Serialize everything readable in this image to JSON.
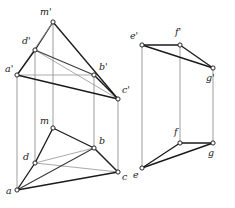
{
  "figure": {
    "type": "descriptive-geometry-diagram",
    "stroke_colors": {
      "dark": "#1b1b1b",
      "mid": "#3a3a3a",
      "light": "#9a9a9a",
      "connector": "#8c8c8c",
      "vertex_fill": "#ffffff",
      "background": "#ffffff"
    },
    "left_object": {
      "name": "left-prism",
      "upper_projection": {
        "name": "upper-view-left",
        "vertices": [
          {
            "id": "m_prime",
            "label": "m'",
            "x": 53,
            "y": 22,
            "label_x": 40,
            "label_y": 15
          },
          {
            "id": "d_prime",
            "label": "d'",
            "x": 35,
            "y": 50,
            "label_x": 22,
            "label_y": 44
          },
          {
            "id": "a_prime",
            "label": "a'",
            "x": 17,
            "y": 75,
            "label_x": 5,
            "label_y": 72
          },
          {
            "id": "b_prime",
            "label": "b'",
            "x": 94,
            "y": 75,
            "label_x": 99,
            "label_y": 70
          },
          {
            "id": "c_prime",
            "label": "c'",
            "x": 118,
            "y": 99,
            "label_x": 122,
            "label_y": 93
          }
        ],
        "edges": [
          {
            "from": "m_prime",
            "to": "d_prime",
            "weight": "dark"
          },
          {
            "from": "m_prime",
            "to": "c_prime",
            "weight": "dark"
          },
          {
            "from": "m_prime",
            "to": "a_prime",
            "weight": "light"
          },
          {
            "from": "d_prime",
            "to": "a_prime",
            "weight": "dark"
          },
          {
            "from": "d_prime",
            "to": "c_prime",
            "weight": "light"
          },
          {
            "from": "d_prime",
            "to": "b_prime",
            "weight": "mid"
          },
          {
            "from": "a_prime",
            "to": "b_prime",
            "weight": "light"
          },
          {
            "from": "a_prime",
            "to": "c_prime",
            "weight": "dark"
          },
          {
            "from": "b_prime",
            "to": "c_prime",
            "weight": "dark"
          }
        ]
      },
      "lower_projection": {
        "name": "lower-view-left",
        "vertices": [
          {
            "id": "m",
            "label": "m",
            "x": 53,
            "y": 128,
            "label_x": 40,
            "label_y": 124
          },
          {
            "id": "d",
            "label": "d",
            "x": 35,
            "y": 163,
            "label_x": 23,
            "label_y": 160
          },
          {
            "id": "a",
            "label": "a",
            "x": 17,
            "y": 190,
            "label_x": 6,
            "label_y": 194
          },
          {
            "id": "b",
            "label": "b",
            "x": 94,
            "y": 148,
            "label_x": 99,
            "label_y": 144
          },
          {
            "id": "c",
            "label": "c",
            "x": 118,
            "y": 172,
            "label_x": 122,
            "label_y": 180
          }
        ],
        "edges": [
          {
            "from": "m",
            "to": "d",
            "weight": "dark"
          },
          {
            "from": "m",
            "to": "b",
            "weight": "dark"
          },
          {
            "from": "d",
            "to": "a",
            "weight": "dark"
          },
          {
            "from": "d",
            "to": "b",
            "weight": "light"
          },
          {
            "from": "d",
            "to": "c",
            "weight": "light"
          },
          {
            "from": "a",
            "to": "b",
            "weight": "mid"
          },
          {
            "from": "a",
            "to": "c",
            "weight": "dark"
          },
          {
            "from": "b",
            "to": "c",
            "weight": "dark"
          }
        ]
      },
      "connectors": [
        {
          "from": "a_prime",
          "to": "a"
        },
        {
          "from": "d_prime",
          "to": "d"
        },
        {
          "from": "m_prime",
          "to": "m"
        },
        {
          "from": "b_prime",
          "to": "b"
        },
        {
          "from": "c_prime",
          "to": "c"
        }
      ]
    },
    "right_object": {
      "name": "right-prism",
      "upper_projection": {
        "name": "upper-view-right",
        "vertices": [
          {
            "id": "e_prime",
            "label": "e'",
            "x": 142,
            "y": 45,
            "label_x": 130,
            "label_y": 39
          },
          {
            "id": "f_prime",
            "label": "f'",
            "x": 180,
            "y": 45,
            "label_x": 175,
            "label_y": 35
          },
          {
            "id": "g_prime",
            "label": "g'",
            "x": 213,
            "y": 68,
            "label_x": 206,
            "label_y": 81
          }
        ],
        "edges": [
          {
            "from": "e_prime",
            "to": "f_prime",
            "weight": "dark"
          },
          {
            "from": "f_prime",
            "to": "g_prime",
            "weight": "dark"
          },
          {
            "from": "e_prime",
            "to": "g_prime",
            "weight": "dark"
          }
        ]
      },
      "lower_projection": {
        "name": "lower-view-right",
        "vertices": [
          {
            "id": "e",
            "label": "e",
            "x": 142,
            "y": 168,
            "label_x": 133,
            "label_y": 178
          },
          {
            "id": "f",
            "label": "f",
            "x": 180,
            "y": 143,
            "label_x": 174,
            "label_y": 135
          },
          {
            "id": "g",
            "label": "g",
            "x": 213,
            "y": 143,
            "label_x": 208,
            "label_y": 156
          }
        ],
        "edges": [
          {
            "from": "e",
            "to": "f",
            "weight": "dark"
          },
          {
            "from": "f",
            "to": "g",
            "weight": "dark"
          },
          {
            "from": "e",
            "to": "g",
            "weight": "dark"
          }
        ]
      },
      "connectors": [
        {
          "from": "e_prime",
          "to": "e"
        },
        {
          "from": "f_prime",
          "to": "f"
        },
        {
          "from": "g_prime",
          "to": "g"
        }
      ]
    }
  }
}
